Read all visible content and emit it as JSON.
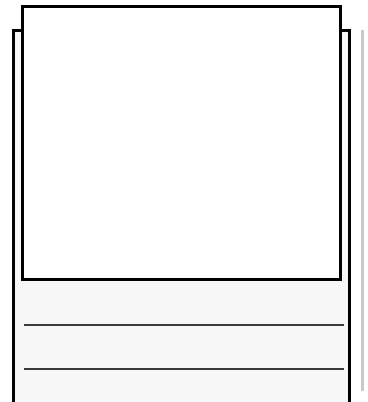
{
  "document": {
    "type": "storyboard-template",
    "drawing_box": {
      "label": ""
    },
    "writing_lines": [
      {
        "text": ""
      },
      {
        "text": ""
      }
    ],
    "colors": {
      "frame": "#000000",
      "rule_line": "#3a3a3a",
      "writing_bg": "#f7f7f7",
      "edge_shadow": "#c8c8c8"
    }
  }
}
